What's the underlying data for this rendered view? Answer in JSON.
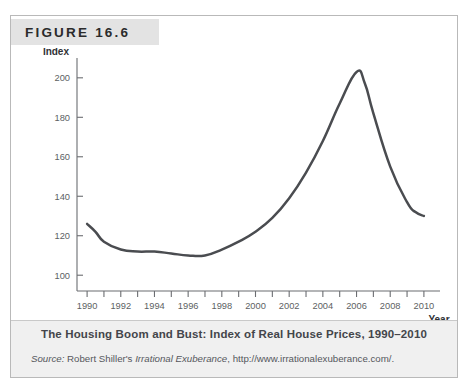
{
  "figure": {
    "label": "FIGURE 16.6",
    "caption_title": "The Housing Boom and Bust: Index of Real House Prices, 1990–2010",
    "source_prefix": "Source:",
    "source_text_1": " Robert Shiller's ",
    "source_italic_work": "Irrational Exuberance",
    "source_text_2": ", http://www.irrationalexuberance.com/."
  },
  "colors": {
    "line": "#4a4c50",
    "axis": "#6b6d71",
    "header_band": "#e3e3e3",
    "caption_band": "#f0f0f0",
    "frame_border": "#b9b9b9",
    "tick_label": "#5d5f63"
  },
  "chart_data": {
    "type": "line",
    "title": "The Housing Boom and Bust: Index of Real House Prices, 1990–2010",
    "xlabel": "Year",
    "ylabel": "Index",
    "xlim": [
      1989.4,
      2010.6
    ],
    "ylim": [
      92,
      207
    ],
    "grid": false,
    "legend": "none",
    "yticks": [
      100,
      120,
      140,
      160,
      180,
      200
    ],
    "ytick_labels": [
      "100",
      "120",
      "140",
      "160",
      "180",
      "200"
    ],
    "xticks": [
      1990,
      1991,
      1992,
      1993,
      1994,
      1995,
      1996,
      1997,
      1998,
      1999,
      2000,
      2001,
      2002,
      2003,
      2004,
      2005,
      2006,
      2007,
      2008,
      2009,
      2010
    ],
    "xtick_labels_major": [
      "1990",
      "1992",
      "1994",
      "1996",
      "1998",
      "2000",
      "2002",
      "2004",
      "2006",
      "2008",
      "2010"
    ],
    "xticks_major": [
      1990,
      1992,
      1994,
      1996,
      1998,
      2000,
      2002,
      2004,
      2006,
      2008,
      2010
    ],
    "series": [
      {
        "name": "Index of Real House Prices",
        "x": [
          1990,
          1990.5,
          1991,
          1992,
          1993,
          1994,
          1995,
          1996,
          1997,
          1998,
          1999,
          2000,
          2001,
          2002,
          2003,
          2004,
          2005,
          2006,
          2006.5,
          2007,
          2008,
          2009,
          2009.5,
          2010
        ],
        "values": [
          126,
          122,
          117,
          113,
          112,
          112,
          111,
          110,
          110,
          113,
          117,
          122,
          129,
          139,
          152,
          168,
          187,
          203,
          197,
          182,
          155,
          137,
          132,
          130
        ]
      }
    ]
  }
}
